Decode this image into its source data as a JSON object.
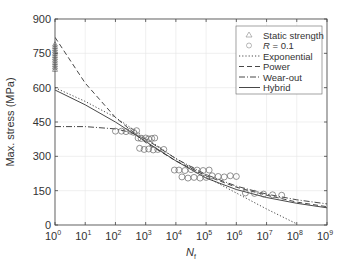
{
  "chart_data": {
    "type": "scatter",
    "title": "",
    "xlabel": "N",
    "xlabel_sub": "f",
    "ylabel": "Max. stress (MPa)",
    "xscale": "log",
    "xlim_exp": [
      0,
      9
    ],
    "ylim": [
      0,
      900
    ],
    "yticks": [
      0,
      150,
      300,
      450,
      600,
      750,
      900
    ],
    "xticks_exp": [
      0,
      1,
      2,
      3,
      4,
      5,
      6,
      7,
      8,
      9
    ],
    "grid": true,
    "legend_position": "upper right",
    "legend": [
      {
        "label": "Static strength",
        "marker": "triangle"
      },
      {
        "label": "R = 0.1",
        "marker": "circle",
        "italic_prefix": "R"
      },
      {
        "label": "Exponential",
        "line": "dotted"
      },
      {
        "label": "Power",
        "line": "dashed"
      },
      {
        "label": "Wear-out",
        "line": "dashdot"
      },
      {
        "label": "Hybrid",
        "line": "solid"
      }
    ],
    "series": [
      {
        "name": "Static strength",
        "kind": "points",
        "marker": "triangle",
        "points": [
          [
            0,
            690
          ],
          [
            0,
            700
          ],
          [
            0,
            710
          ],
          [
            0,
            720
          ],
          [
            0,
            730
          ],
          [
            0,
            740
          ],
          [
            0,
            750
          ],
          [
            0,
            760
          ],
          [
            0,
            770
          ],
          [
            0,
            780
          ],
          [
            0,
            790
          ],
          [
            0,
            680
          ]
        ]
      },
      {
        "name": "R = 0.1",
        "kind": "points",
        "marker": "circle",
        "points": [
          [
            2.0,
            410
          ],
          [
            2.2,
            410
          ],
          [
            2.35,
            408
          ],
          [
            2.5,
            410
          ],
          [
            2.6,
            405
          ],
          [
            2.7,
            412
          ],
          [
            2.75,
            380
          ],
          [
            2.85,
            378
          ],
          [
            3.0,
            380
          ],
          [
            3.1,
            376
          ],
          [
            3.2,
            378
          ],
          [
            3.3,
            380
          ],
          [
            2.8,
            335
          ],
          [
            2.95,
            330
          ],
          [
            3.1,
            332
          ],
          [
            3.25,
            328
          ],
          [
            3.4,
            330
          ],
          [
            3.6,
            330
          ],
          [
            3.95,
            240
          ],
          [
            4.1,
            240
          ],
          [
            4.3,
            238
          ],
          [
            4.5,
            242
          ],
          [
            4.7,
            240
          ],
          [
            4.9,
            238
          ],
          [
            5.1,
            240
          ],
          [
            4.2,
            210
          ],
          [
            4.4,
            205
          ],
          [
            4.6,
            208
          ],
          [
            4.8,
            205
          ],
          [
            5.0,
            208
          ],
          [
            5.2,
            215
          ],
          [
            5.4,
            212
          ],
          [
            5.6,
            210
          ],
          [
            5.8,
            215
          ],
          [
            6.0,
            212
          ],
          [
            6.3,
            140
          ],
          [
            6.6,
            138
          ],
          [
            6.9,
            135
          ],
          [
            7.2,
            132
          ],
          [
            7.5,
            130
          ]
        ]
      },
      {
        "name": "Exponential",
        "kind": "line",
        "dash": "1.2,2",
        "points": [
          [
            0,
            600
          ],
          [
            1,
            540
          ],
          [
            2,
            470
          ],
          [
            3,
            380
          ],
          [
            4,
            290
          ],
          [
            5,
            210
          ],
          [
            6,
            140
          ],
          [
            7,
            70
          ],
          [
            8,
            5
          ]
        ]
      },
      {
        "name": "Power",
        "kind": "line",
        "dash": "5,3",
        "points": [
          [
            0,
            820
          ],
          [
            1,
            620
          ],
          [
            2,
            470
          ],
          [
            3,
            360
          ],
          [
            4,
            280
          ],
          [
            5,
            215
          ],
          [
            6,
            165
          ],
          [
            7,
            130
          ],
          [
            8,
            100
          ],
          [
            9,
            80
          ]
        ]
      },
      {
        "name": "Wear-out",
        "kind": "line",
        "dash": "6,2,1,2",
        "points": [
          [
            0,
            430
          ],
          [
            1,
            430
          ],
          [
            2,
            420
          ],
          [
            2.5,
            405
          ],
          [
            3,
            375
          ],
          [
            4,
            290
          ],
          [
            5,
            220
          ],
          [
            6,
            170
          ],
          [
            7,
            135
          ],
          [
            8,
            110
          ],
          [
            9,
            92
          ]
        ]
      },
      {
        "name": "Hybrid",
        "kind": "line",
        "dash": "",
        "points": [
          [
            0,
            590
          ],
          [
            1,
            525
          ],
          [
            2,
            450
          ],
          [
            3,
            365
          ],
          [
            4,
            280
          ],
          [
            5,
            205
          ],
          [
            6,
            155
          ],
          [
            7,
            120
          ],
          [
            8,
            95
          ],
          [
            9,
            75
          ]
        ]
      }
    ]
  }
}
